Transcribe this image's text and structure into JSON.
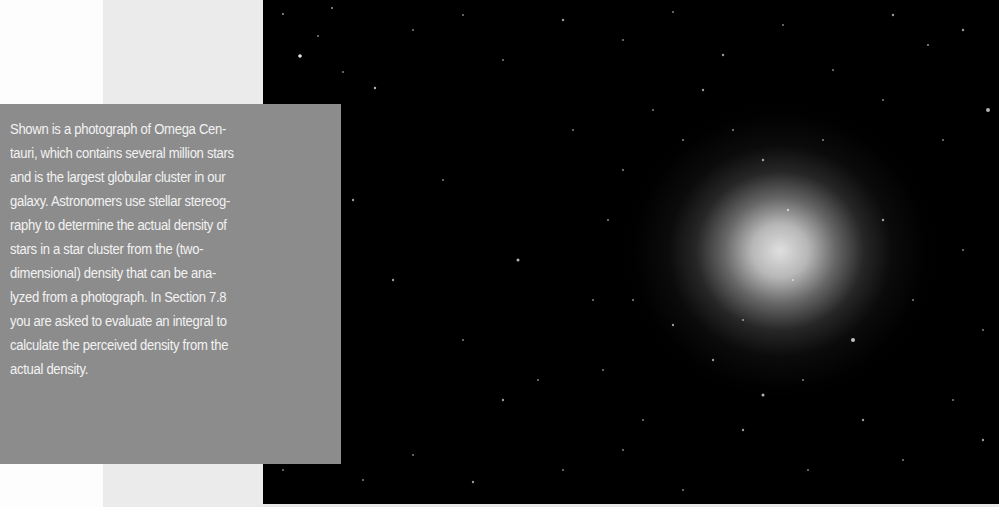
{
  "figure": {
    "background_color": "#000000",
    "panel_color": "#ebebeb",
    "caption_box_color": "#8c8c8c",
    "caption_text_color": "#f2f2f2"
  },
  "caption": {
    "lines": [
      "Shown is a photograph of Omega Cen-",
      "tauri, which contains several million stars",
      "and is the largest globular cluster in our",
      "galaxy. Astronomers use stellar stereog-",
      "raphy to determine the actual density of",
      "stars in a star cluster from the (two-",
      "dimensional) density that can be ana-",
      "lyzed from a photograph. In Section 7.8",
      "you are asked to evaluate an integral to",
      "calculate the perceived density from the",
      "actual density."
    ]
  }
}
